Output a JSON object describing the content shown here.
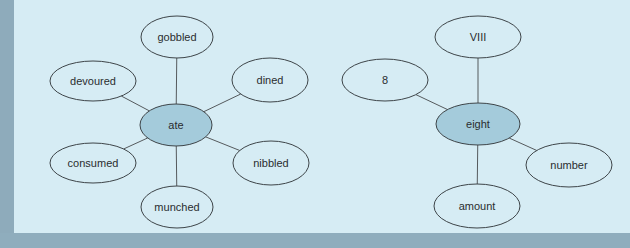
{
  "colors": {
    "background_panel": "#d6ecf4",
    "frame": "#8fadbd",
    "center_node_fill": "#a4cbdb",
    "node_stroke": "#3d4448",
    "edge": "#555a5d",
    "text": "#2a2d2f"
  },
  "diagrams": [
    {
      "name": "ate-synonyms",
      "center": {
        "label": "ate"
      },
      "nodes": [
        {
          "id": "gobbled",
          "label": "gobbled"
        },
        {
          "id": "devoured",
          "label": "devoured"
        },
        {
          "id": "dined",
          "label": "dined"
        },
        {
          "id": "consumed",
          "label": "consumed"
        },
        {
          "id": "nibbled",
          "label": "nibbled"
        },
        {
          "id": "munched",
          "label": "munched"
        }
      ]
    },
    {
      "name": "eight-related",
      "center": {
        "label": "eight"
      },
      "nodes": [
        {
          "id": "viii",
          "label": "VIII"
        },
        {
          "id": "8",
          "label": "8"
        },
        {
          "id": "number",
          "label": "number"
        },
        {
          "id": "amount",
          "label": "amount"
        }
      ]
    }
  ]
}
